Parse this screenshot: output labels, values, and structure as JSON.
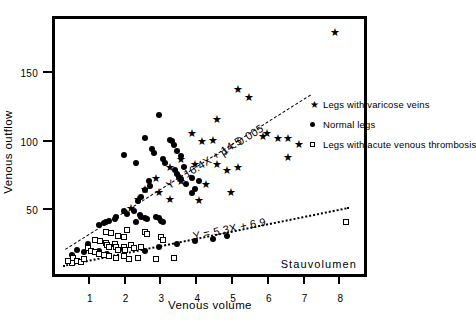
{
  "chart_data": {
    "type": "scatter",
    "title": "",
    "xlabel": "Venous volume",
    "ylabel": "Venous outflow",
    "xlim": [
      0,
      8.8
    ],
    "ylim": [
      0,
      190
    ],
    "xticks": [
      1,
      2,
      3,
      4,
      5,
      6,
      7,
      8
    ],
    "yticks": [
      50,
      100,
      150
    ],
    "grid": false,
    "legend_position": "right",
    "annotations": [
      {
        "name": "stauvolumen-note",
        "text": "Stauvolumen"
      }
    ],
    "fits": [
      {
        "name": "varicose-fit",
        "label": "Y = 16.4X + 14.5",
        "significance": "p < 0.005",
        "style": "dashed",
        "slope": 16.4,
        "intercept": 14.5,
        "x_start": 0.35,
        "x_end": 7.2
      },
      {
        "name": "thrombosis-fit",
        "label": "Y = 5.3X + 6.9",
        "significance": "",
        "style": "dotted",
        "slope": 5.3,
        "intercept": 6.9,
        "x_start": 0.3,
        "x_end": 8.3
      }
    ],
    "series": [
      {
        "name": "varicose",
        "label": "Legs with varicose veins",
        "marker": "star",
        "color": "#000000",
        "points": [
          [
            7.9,
            178
          ],
          [
            5.2,
            137
          ],
          [
            5.5,
            131
          ],
          [
            4.6,
            115
          ],
          [
            3.9,
            105
          ],
          [
            6.0,
            105
          ],
          [
            5.9,
            103
          ],
          [
            6.3,
            101
          ],
          [
            6.6,
            101
          ],
          [
            6.9,
            97
          ],
          [
            4.5,
            100
          ],
          [
            4.2,
            99
          ],
          [
            3.6,
            86
          ],
          [
            4.0,
            82
          ],
          [
            4.6,
            82
          ],
          [
            5.2,
            80
          ],
          [
            3.3,
            80
          ],
          [
            4.9,
            78
          ],
          [
            6.6,
            87
          ],
          [
            2.9,
            72
          ],
          [
            3.6,
            70
          ],
          [
            4.3,
            68
          ],
          [
            3.0,
            62
          ],
          [
            2.6,
            64
          ],
          [
            5.0,
            62
          ],
          [
            2.4,
            57
          ],
          [
            3.3,
            57
          ],
          [
            4.1,
            56
          ],
          [
            2.2,
            50
          ]
        ]
      },
      {
        "name": "normal",
        "label": "Normal legs",
        "marker": "circle",
        "color": "#000000",
        "points": [
          [
            3.0,
            118
          ],
          [
            2.6,
            101
          ],
          [
            3.3,
            100
          ],
          [
            3.35,
            99
          ],
          [
            3.4,
            96
          ],
          [
            2.8,
            93
          ],
          [
            2.85,
            90
          ],
          [
            2.0,
            89
          ],
          [
            3.5,
            92
          ],
          [
            3.6,
            88
          ],
          [
            3.1,
            86
          ],
          [
            3.15,
            83
          ],
          [
            2.35,
            83
          ],
          [
            3.7,
            80
          ],
          [
            3.45,
            78
          ],
          [
            3.5,
            75
          ],
          [
            3.55,
            73
          ],
          [
            3.6,
            71
          ],
          [
            3.9,
            72
          ],
          [
            4.1,
            70
          ],
          [
            3.75,
            68
          ],
          [
            2.7,
            70
          ],
          [
            2.75,
            66
          ],
          [
            2.6,
            63
          ],
          [
            4.0,
            64
          ],
          [
            3.9,
            61
          ],
          [
            2.5,
            58
          ],
          [
            2.4,
            55
          ],
          [
            2.0,
            48
          ],
          [
            2.1,
            46
          ],
          [
            2.45,
            45
          ],
          [
            2.5,
            44
          ],
          [
            2.6,
            43
          ],
          [
            2.65,
            42
          ],
          [
            2.9,
            44
          ],
          [
            3.0,
            43
          ],
          [
            3.05,
            41
          ],
          [
            3.1,
            40
          ],
          [
            1.8,
            44
          ],
          [
            1.75,
            42
          ],
          [
            1.6,
            41
          ],
          [
            1.5,
            40
          ],
          [
            1.45,
            39
          ],
          [
            1.3,
            38
          ],
          [
            2.3,
            48
          ],
          [
            2.35,
            40
          ],
          [
            1.0,
            24
          ],
          [
            0.7,
            20
          ],
          [
            0.9,
            18
          ],
          [
            0.55,
            16
          ],
          [
            1.3,
            19
          ],
          [
            1.55,
            17
          ],
          [
            2.0,
            20
          ],
          [
            2.6,
            19
          ],
          [
            3.0,
            22
          ],
          [
            3.5,
            24
          ],
          [
            4.0,
            26
          ],
          [
            4.5,
            28
          ],
          [
            4.9,
            30
          ]
        ]
      },
      {
        "name": "thrombosis",
        "label": "Legs with acute venous thrombosis",
        "marker": "square",
        "color": "#000000",
        "points": [
          [
            1.5,
            33
          ],
          [
            1.65,
            32
          ],
          [
            2.1,
            34
          ],
          [
            2.6,
            33
          ],
          [
            2.65,
            31
          ],
          [
            2.0,
            29
          ],
          [
            1.2,
            27
          ],
          [
            1.35,
            26
          ],
          [
            1.5,
            25
          ],
          [
            1.55,
            23
          ],
          [
            1.6,
            22
          ],
          [
            1.75,
            24
          ],
          [
            1.8,
            22
          ],
          [
            1.85,
            20
          ],
          [
            2.0,
            22
          ],
          [
            2.05,
            20
          ],
          [
            2.2,
            23
          ],
          [
            2.3,
            21
          ],
          [
            2.5,
            22
          ],
          [
            1.0,
            21
          ],
          [
            1.1,
            19
          ],
          [
            1.2,
            18
          ],
          [
            1.3,
            17
          ],
          [
            1.45,
            16
          ],
          [
            1.6,
            15
          ],
          [
            1.8,
            14
          ],
          [
            2.0,
            15
          ],
          [
            2.15,
            13
          ],
          [
            2.4,
            14
          ],
          [
            2.9,
            13
          ],
          [
            3.4,
            14
          ],
          [
            0.6,
            14
          ],
          [
            0.7,
            12
          ],
          [
            0.8,
            11
          ],
          [
            0.9,
            13
          ],
          [
            0.55,
            10
          ],
          [
            0.45,
            12
          ],
          [
            3.05,
            29
          ],
          [
            3.1,
            27
          ],
          [
            8.2,
            40
          ],
          [
            1.85,
            30
          ]
        ]
      }
    ]
  },
  "legend": {
    "items": [
      {
        "marker": "star",
        "label": "Legs with varicose veins"
      },
      {
        "marker": "circle",
        "label": "Normal legs"
      },
      {
        "marker": "square",
        "label": "Legs with acute venous thrombosis"
      }
    ]
  }
}
